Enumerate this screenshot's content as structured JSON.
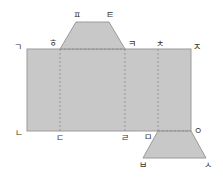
{
  "diagram": {
    "type": "net",
    "fill_color": "#c8c8c8",
    "stroke_color": "#9a9a9a",
    "dash_color": "#8a8a8a",
    "labels": {
      "giyeok": "ㄱ",
      "nieun": "ㄴ",
      "digeut": "ㄷ",
      "rieul": "ㄹ",
      "mieum": "ㅁ",
      "bieup": "ㅂ",
      "siot": "ㅅ",
      "ieung": "ㅇ",
      "jieut": "ㅈ",
      "chieut": "ㅊ",
      "kieuk": "ㅋ",
      "tieut": "ㅌ",
      "pieup": "ㅍ",
      "hieut": "ㅎ"
    }
  }
}
